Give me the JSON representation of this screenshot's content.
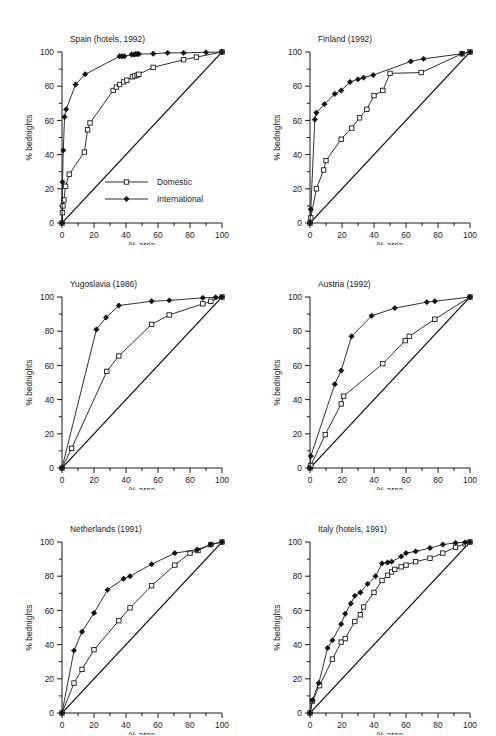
{
  "figure": {
    "panel_count": 6,
    "axis": {
      "xlabel": "% area",
      "ylabel": "% bednights",
      "xticks": [
        0,
        20,
        40,
        60,
        80,
        100
      ],
      "yticks": [
        0,
        20,
        40,
        60,
        80,
        100
      ],
      "xlim": [
        0,
        100
      ],
      "ylim": [
        0,
        100
      ],
      "minor_tick_step": 10
    },
    "legend": {
      "present_in_panel": "Spain (hotels, 1992)",
      "entries": [
        {
          "label": "Domestic",
          "marker": "open-square"
        },
        {
          "label": "International",
          "marker": "filled-diamond"
        }
      ]
    }
  },
  "chart_data": [
    {
      "type": "line",
      "title": "Spain (hotels, 1992)",
      "xlabel": "% area",
      "ylabel": "% bednights",
      "xlim": [
        0,
        100
      ],
      "ylim": [
        0,
        100
      ],
      "grid": false,
      "legend_position": "center-right",
      "annotations": [
        "diagonal line of equality from (0,0) to (100,100)"
      ],
      "series": [
        {
          "name": "Domestic",
          "marker": "open-square",
          "x": [
            0,
            0.3,
            0.6,
            1.2,
            2.2,
            4.5,
            14,
            16,
            17.5,
            32,
            34,
            36,
            38.5,
            40.5,
            44,
            45.5,
            47,
            48,
            57,
            76,
            84,
            100
          ],
          "y": [
            0,
            6,
            10,
            13.5,
            21.5,
            28.5,
            41.5,
            54.5,
            58.5,
            77.5,
            79.5,
            81,
            82.5,
            83.5,
            85.5,
            86,
            86.5,
            87,
            91,
            95.5,
            97,
            100
          ]
        },
        {
          "name": "International",
          "marker": "filled-diamond",
          "x": [
            0,
            0.3,
            0.8,
            1.6,
            2.6,
            8.5,
            14.5,
            36,
            37.5,
            39,
            43.5,
            45,
            46,
            47,
            48,
            57,
            66,
            76,
            90,
            100
          ],
          "y": [
            0,
            24,
            42.5,
            62,
            66.5,
            81,
            87,
            97.5,
            97.5,
            97.5,
            98.5,
            98.5,
            98.8,
            98.8,
            98.8,
            99,
            99.5,
            99.5,
            99.8,
            100
          ]
        }
      ]
    },
    {
      "type": "line",
      "title": "Finland (1992)",
      "xlabel": "% area",
      "ylabel": "% bednights",
      "xlim": [
        0,
        100
      ],
      "ylim": [
        0,
        100
      ],
      "grid": false,
      "legend_position": "none",
      "annotations": [
        "diagonal line of equality from (0,0) to (100,100)"
      ],
      "series": [
        {
          "name": "Domestic",
          "marker": "open-square",
          "x": [
            0,
            0.5,
            4,
            8.5,
            10,
            19.5,
            26,
            31,
            35.5,
            40,
            45.5,
            50,
            69.5,
            95,
            100
          ],
          "y": [
            0,
            3,
            20,
            31,
            36.5,
            49,
            55.5,
            61.5,
            66.5,
            74.5,
            77.5,
            87.5,
            88,
            99,
            100
          ]
        },
        {
          "name": "International",
          "marker": "filled-diamond",
          "x": [
            0,
            0.5,
            3,
            4,
            9,
            15.5,
            19.5,
            25,
            30,
            33.5,
            39.5,
            63,
            71,
            95,
            100
          ],
          "y": [
            0,
            8,
            60.5,
            64.5,
            69.5,
            75.5,
            77.5,
            82.5,
            84,
            85,
            86.5,
            94.5,
            96,
            99,
            100
          ]
        }
      ]
    },
    {
      "type": "line",
      "title": "Yugoslavia (1986)",
      "xlabel": "% area",
      "ylabel": "% bednights",
      "xlim": [
        0,
        100
      ],
      "ylim": [
        0,
        100
      ],
      "grid": false,
      "legend_position": "none",
      "annotations": [
        "diagonal line of equality from (0,0) to (100,100)"
      ],
      "series": [
        {
          "name": "Domestic",
          "marker": "open-square",
          "x": [
            0,
            6,
            28,
            35.5,
            56,
            67,
            88,
            93,
            100
          ],
          "y": [
            0,
            11.5,
            56.5,
            65.5,
            84,
            89.5,
            96,
            97.5,
            100
          ]
        },
        {
          "name": "International",
          "marker": "filled-diamond",
          "x": [
            0,
            21.5,
            27.5,
            35.5,
            56,
            67,
            88,
            96,
            100
          ],
          "y": [
            0,
            81,
            88,
            95,
            97.5,
            98,
            99.5,
            99.8,
            100
          ]
        }
      ]
    },
    {
      "type": "line",
      "title": "Austria (1992)",
      "xlabel": "% area",
      "ylabel": "% bednights",
      "xlim": [
        0,
        100
      ],
      "ylim": [
        0,
        100
      ],
      "grid": false,
      "legend_position": "none",
      "annotations": [
        "diagonal line of equality from (0,0) to (100,100)"
      ],
      "series": [
        {
          "name": "Domestic",
          "marker": "open-square",
          "x": [
            0,
            0.5,
            9.5,
            19.5,
            21,
            45.5,
            59.5,
            62,
            78,
            100
          ],
          "y": [
            0,
            1.5,
            19.5,
            37.5,
            42,
            61,
            74.5,
            77,
            87,
            100
          ]
        },
        {
          "name": "International",
          "marker": "filled-diamond",
          "x": [
            0,
            0.5,
            15.5,
            19.5,
            26,
            38.5,
            53,
            73,
            78,
            100
          ],
          "y": [
            0,
            7,
            49,
            57,
            77,
            89,
            93.5,
            97,
            97.5,
            100
          ]
        }
      ]
    },
    {
      "type": "line",
      "title": "Netherlands (1991)",
      "xlabel": "% area",
      "ylabel": "% bednights",
      "xlim": [
        0,
        100
      ],
      "ylim": [
        0,
        100
      ],
      "grid": false,
      "legend_position": "none",
      "annotations": [
        "diagonal line of equality from (0,0) to (100,100)"
      ],
      "series": [
        {
          "name": "Domestic",
          "marker": "open-square",
          "x": [
            0,
            7.5,
            12.5,
            20,
            35.5,
            42.5,
            56,
            70.5,
            80,
            85,
            93,
            100
          ],
          "y": [
            0,
            17.5,
            25.5,
            37,
            54,
            61.5,
            74.5,
            86.5,
            93.5,
            95,
            98.5,
            100
          ]
        },
        {
          "name": "International",
          "marker": "filled-diamond",
          "x": [
            0,
            7.5,
            12.5,
            20,
            28.5,
            38.5,
            42.5,
            56,
            70.5,
            84.5,
            93,
            100
          ],
          "y": [
            0,
            36.5,
            47.5,
            58.5,
            72,
            78.5,
            80,
            87,
            93.5,
            95.5,
            98.5,
            100
          ]
        }
      ]
    },
    {
      "type": "line",
      "title": "Italy (hotels, 1991)",
      "xlabel": "% area",
      "ylabel": "% bednights",
      "xlim": [
        0,
        100
      ],
      "ylim": [
        0,
        100
      ],
      "grid": false,
      "legend_position": "none",
      "annotations": [
        "diagonal line of equality from (0,0) to (100,100)"
      ],
      "series": [
        {
          "name": "Domestic",
          "marker": "open-square",
          "x": [
            0,
            1.5,
            6,
            14,
            19.5,
            22,
            28,
            31.5,
            33.5,
            40,
            45,
            48.5,
            51,
            53,
            57,
            60,
            66,
            75,
            83,
            91,
            97,
            100
          ],
          "y": [
            0,
            7,
            16,
            31.5,
            41.5,
            43.5,
            53.5,
            57.5,
            62,
            70.5,
            77.5,
            80.5,
            82.5,
            84,
            85.5,
            86.5,
            88.5,
            90.5,
            93.5,
            97,
            99,
            100
          ]
        },
        {
          "name": "International",
          "marker": "filled-diamond",
          "x": [
            0,
            1.5,
            5.5,
            11,
            14,
            19.5,
            22,
            25.5,
            28,
            31.5,
            36,
            41,
            45,
            48.5,
            51,
            57,
            60,
            66,
            75,
            83,
            91,
            97,
            100
          ],
          "y": [
            0,
            7.5,
            17.5,
            38,
            42.5,
            52,
            58,
            64,
            68.5,
            70.5,
            75.5,
            80,
            87.5,
            88,
            88.5,
            91.5,
            93.5,
            94.5,
            96.5,
            98.5,
            99.5,
            99.8,
            100
          ]
        }
      ]
    }
  ]
}
